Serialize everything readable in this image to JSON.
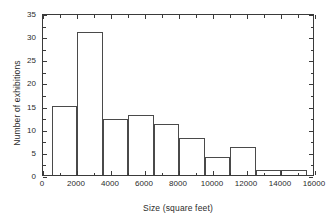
{
  "chart_data": {
    "type": "bar",
    "title": "",
    "subtitle": "",
    "xlabel": "Size (square feet)",
    "ylabel": "Number of exhibitions",
    "xlim": [
      0,
      16000
    ],
    "ylim": [
      0,
      35
    ],
    "grid": false,
    "legend": null,
    "bin_width": 1500,
    "bin_edges": [
      500,
      2000,
      3500,
      5000,
      6500,
      8000,
      9500,
      11000,
      12500,
      14000,
      15500
    ],
    "categories": [
      "500-2000",
      "2000-3500",
      "3500-5000",
      "5000-6500",
      "6500-8000",
      "8000-9500",
      "9500-11000",
      "11000-12500",
      "12500-14000",
      "14000-15500"
    ],
    "values": [
      15,
      31,
      12,
      13,
      11,
      8,
      4,
      6,
      1,
      1
    ],
    "xticks": [
      0,
      2000,
      4000,
      6000,
      8000,
      10000,
      12000,
      14000,
      16000
    ],
    "xtick_labels": [
      "0",
      "2000",
      "4000",
      "6000",
      "8000",
      "10000",
      "12000",
      "14000",
      "16000"
    ],
    "yticks": [
      0,
      5,
      10,
      15,
      20,
      25,
      30,
      35
    ],
    "ytick_labels": [
      "0",
      "5",
      "10",
      "15",
      "20",
      "25",
      "30",
      "35"
    ],
    "colors": {
      "bar_edge": "#4a4a4a",
      "bar_fill": "transparent",
      "axis": "#3a3a3a",
      "text": "#2b2b2b",
      "background": "#ffffff"
    }
  }
}
